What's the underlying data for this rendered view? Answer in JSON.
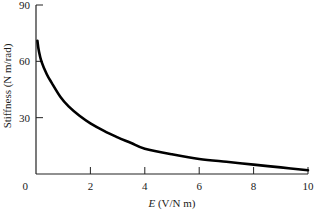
{
  "chart_data": {
    "type": "line",
    "title": "",
    "xlabel_italic": "E",
    "xlabel_rest": " (V/N m)",
    "xlabel": "E (V/N m)",
    "ylabel": "Stiffness (N m/rad)",
    "xlim": [
      0,
      10
    ],
    "ylim": [
      0,
      90
    ],
    "xticks": [
      0,
      2,
      4,
      6,
      8,
      10
    ],
    "yticks": [
      0,
      30,
      60,
      90
    ],
    "grid": false,
    "legend": null,
    "series": [
      {
        "name": "Stiffness",
        "color": "#000000",
        "x": [
          0.05,
          0.1,
          0.2,
          0.4,
          0.6,
          0.9,
          1.2,
          1.6,
          2.0,
          2.5,
          3.0,
          3.5,
          4.0,
          5.0,
          6.0,
          7.0,
          8.0,
          9.0,
          10.0
        ],
        "y": [
          71,
          66,
          60,
          53,
          48,
          41,
          36,
          31,
          27,
          23,
          19.5,
          16.5,
          13.5,
          10.5,
          8,
          6.5,
          5,
          3.5,
          2
        ]
      }
    ]
  }
}
